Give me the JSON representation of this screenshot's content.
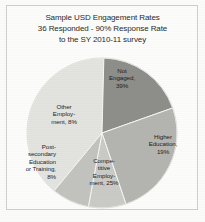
{
  "chart_data": {
    "type": "pie",
    "title": "Sample USD Engagement Rates 36 Responded - 90% Response Rate to the SY 2010-11 survey",
    "title_lines": [
      "Sample USD Engagement Rates",
      "36 Responded -  90% Response Rate",
      "to the SY 2010-11 survey"
    ],
    "xlabel": "",
    "ylabel": "",
    "legend": "none",
    "grid": false,
    "labels_inside": true,
    "categories": [
      "Not Engaged",
      "Higher Education",
      "Competitive Employment",
      "Post-secondary Education or Training",
      "Other Employment"
    ],
    "values": [
      39,
      19,
      25,
      8,
      8
    ],
    "value_unit": "%",
    "slices": [
      {
        "name": "Not Engaged",
        "value": 39,
        "label_lines": [
          "Not",
          "Engaged,",
          "39%"
        ],
        "color": "#e3e3e0"
      },
      {
        "name": "Higher Education",
        "value": 19,
        "label_lines": [
          "Higher",
          "Education,",
          "19%"
        ],
        "color": "#8e8e8b"
      },
      {
        "name": "Competitive Employment",
        "value": 25,
        "label_lines": [
          "Compe-",
          "titive",
          "Employ-",
          "ment, 25%"
        ],
        "color": "#b4b4b0"
      },
      {
        "name": "Post-secondary Education or Training",
        "value": 8,
        "label_lines": [
          "Post-",
          "secondary",
          "Education",
          "or Training,",
          "8%"
        ],
        "color": "#cacac6"
      },
      {
        "name": "Other Employment",
        "value": 8,
        "label_lines": [
          "Other",
          "Employ-",
          "ment, 8%"
        ],
        "color": "#c2c2be"
      }
    ]
  }
}
